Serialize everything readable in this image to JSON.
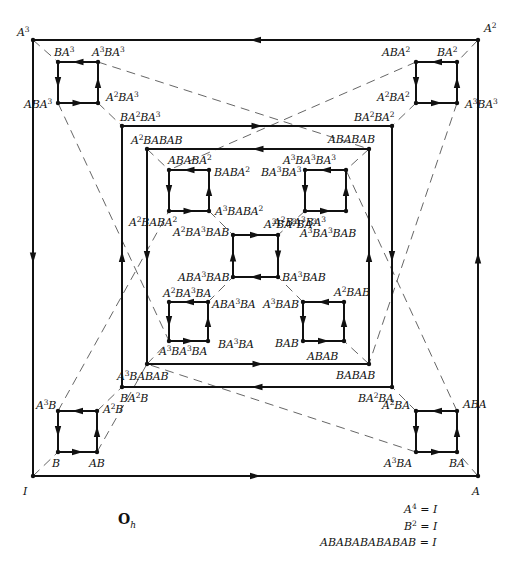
{
  "diagram": {
    "title": "O",
    "title_subscript": "h",
    "relations": [
      {
        "lhs": "A^4",
        "rhs": "I"
      },
      {
        "lhs": "B^2",
        "rhs": "I"
      },
      {
        "lhs": "ABABABABABAB",
        "rhs": "I"
      }
    ],
    "colors": {
      "line": "#111111",
      "dash": "#555555",
      "background": "#ffffff"
    },
    "squares": [
      {
        "id": "outer",
        "x1": 33,
        "y1": 40,
        "x2": 478,
        "y2": 476,
        "direction": "ccw-top-left",
        "labels": {
          "tl": "A^3",
          "tr": "A^2",
          "bl": "I",
          "br": "A"
        }
      },
      {
        "id": "middle",
        "x1": 122,
        "y1": 126,
        "x2": 392,
        "y2": 387,
        "labels": {
          "tl": "BA^2BA^3",
          "tr": "BA^2BA^2",
          "bl": "BA^2B",
          "br": "BA^2BA"
        }
      },
      {
        "id": "inner",
        "x1": 147,
        "y1": 149,
        "x2": 369,
        "y2": 364,
        "labels": {
          "tl": "A^2BABAB",
          "tr": "ABABAB",
          "bl": "A^3BABAB",
          "br": "BABAB"
        }
      },
      {
        "id": "corner-tl",
        "x1": 58,
        "y1": 62,
        "x2": 98,
        "y2": 103,
        "labels": {
          "tl": "BA^3",
          "tr": "A^3BA^3",
          "bl": "ABA^3",
          "br": "A^2BA^3"
        }
      },
      {
        "id": "corner-tr",
        "x1": 416,
        "y1": 62,
        "x2": 457,
        "y2": 103,
        "labels": {
          "tl": "ABA^2",
          "tr": "BA^2",
          "bl": "A^2BA^2",
          "br": "A^3BA^3"
        }
      },
      {
        "id": "corner-bl",
        "x1": 58,
        "y1": 411,
        "x2": 97,
        "y2": 452,
        "labels": {
          "tl": "A^3B",
          "tr": "A^2B",
          "bl": "B",
          "br": "AB"
        }
      },
      {
        "id": "corner-br",
        "x1": 416,
        "y1": 411,
        "x2": 457,
        "y2": 452,
        "labels": {
          "tl": "A^2BA",
          "tr": "ABA",
          "bl": "A^3BA",
          "br": "BA"
        }
      },
      {
        "id": "inner-tl",
        "x1": 169,
        "y1": 170,
        "x2": 209,
        "y2": 211,
        "labels": {
          "tl": "ABABA^2",
          "tr": "BABA^2",
          "bl": "A^2BABA^2",
          "br": "A^3BABA^2"
        }
      },
      {
        "id": "inner-tr",
        "x1": 305,
        "y1": 170,
        "x2": 346,
        "y2": 211,
        "labels": {
          "tl": "BA^3BA^3",
          "tr": "A^3BA^3BA^3",
          "bl": "A^2BA^3BA^3",
          "br": "A^3BA^3BAB"
        }
      },
      {
        "id": "center",
        "x1": 233,
        "y1": 235,
        "x2": 278,
        "y2": 277,
        "labels": {
          "tl": "A^2BA^3BAB",
          "tr": "A^3BA^3BA^3",
          "bl": "ABA^3BAB",
          "br": "BA^3BAB"
        }
      },
      {
        "id": "inner-bl",
        "x1": 169,
        "y1": 302,
        "x2": 208,
        "y2": 341,
        "labels": {
          "tl": "A^2BA^3BA",
          "tr": "ABA^3BA",
          "bl": "A^3BA^3BA",
          "br": "BA^3BA"
        }
      },
      {
        "id": "inner-br",
        "x1": 303,
        "y1": 302,
        "x2": 344,
        "y2": 341,
        "labels": {
          "tl": "A^3BAB",
          "tr": "A^2BAB",
          "bl": "BAB",
          "br": "ABAB"
        }
      }
    ],
    "dashed_edges_note": "B-edges (dashed) connect vertices between squares"
  }
}
